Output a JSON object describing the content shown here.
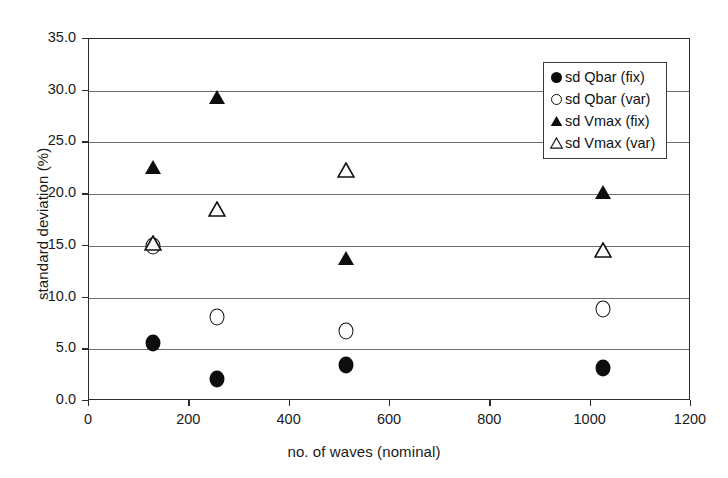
{
  "chart_data": {
    "type": "scatter",
    "title": "",
    "xlabel": "no. of waves (nominal)",
    "ylabel": "standard deviation (%)",
    "xlim": [
      0,
      1200
    ],
    "ylim": [
      0.0,
      35.0
    ],
    "xticks": [
      "0",
      "200",
      "400",
      "600",
      "800",
      "1000",
      "1200"
    ],
    "xtick_values": [
      0,
      200,
      400,
      600,
      800,
      1000,
      1200
    ],
    "yticks": [
      "0.0",
      "5.0",
      "10.0",
      "15.0",
      "20.0",
      "25.0",
      "30.0",
      "35.0"
    ],
    "ytick_values": [
      0.0,
      5.0,
      10.0,
      15.0,
      20.0,
      25.0,
      30.0,
      35.0
    ],
    "grid": "horizontal",
    "legend_position": "top-right",
    "x": [
      128,
      256,
      512,
      1024
    ],
    "series": [
      {
        "name": "sd Qbar (fix)",
        "marker": "filled-circle",
        "color": "#0d0d0d",
        "values": [
          5.6,
          2.1,
          3.5,
          3.2
        ]
      },
      {
        "name": "sd Qbar (var)",
        "marker": "open-circle",
        "color": "#111111",
        "values": [
          15.0,
          8.1,
          6.8,
          8.9
        ]
      },
      {
        "name": "sd Vmax (fix)",
        "marker": "filled-triangle",
        "color": "#0d0d0d",
        "values": [
          22.6,
          29.4,
          13.8,
          20.2
        ]
      },
      {
        "name": "sd Vmax (var)",
        "marker": "open-triangle",
        "color": "#111111",
        "values": [
          15.3,
          18.6,
          22.3,
          14.6
        ]
      }
    ]
  }
}
